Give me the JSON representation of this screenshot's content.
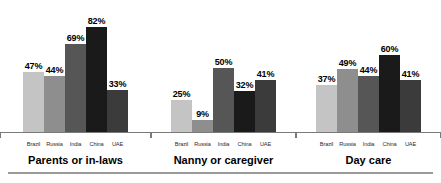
{
  "chart_data": {
    "type": "bar",
    "title": "",
    "subtitle": "",
    "xlabel": "",
    "ylabel": "",
    "ylim": [
      0,
      100
    ],
    "grid": false,
    "legend_position": "none",
    "value_suffix": "%",
    "categories": [
      "Brazil",
      "Russia",
      "India",
      "China",
      "UAE"
    ],
    "groups": [
      {
        "label": "Parents or in-laws",
        "values": [
          47,
          44,
          69,
          82,
          33
        ],
        "value_labels": [
          "47%",
          "44%",
          "69%",
          "82%",
          "33%"
        ]
      },
      {
        "label": "Nanny or caregiver",
        "values": [
          25,
          9,
          50,
          32,
          41
        ],
        "value_labels": [
          "25%",
          "9%",
          "50%",
          "32%",
          "41%"
        ]
      },
      {
        "label": "Day care",
        "values": [
          37,
          49,
          44,
          60,
          41
        ],
        "value_labels": [
          "37%",
          "49%",
          "44%",
          "60%",
          "41%"
        ]
      }
    ],
    "series_colors": {
      "Brazil": "#c4c4c4",
      "Russia": "#8e8e8e",
      "India": "#565656",
      "China": "#1a1a1a",
      "UAE": "#3b3b3b"
    },
    "axis_color": "#7a7a7a",
    "rule_color": "#9a9a9a",
    "background": "#ffffff"
  }
}
